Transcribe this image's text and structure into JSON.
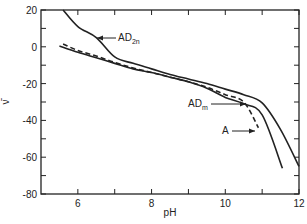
{
  "chart_data": {
    "type": "line",
    "title": "",
    "xlabel": "pH",
    "ylabel": "ν̄",
    "xlim": [
      5,
      12
    ],
    "ylim": [
      -80,
      20
    ],
    "x_ticks": [
      6,
      7,
      8,
      9,
      10,
      11,
      12
    ],
    "x_tick_labels": [
      "6",
      "8",
      "10",
      "12"
    ],
    "y_ticks": [
      20,
      10,
      0,
      -10,
      -20,
      -30,
      -40,
      -50,
      -60,
      -70,
      -80
    ],
    "y_tick_labels": [
      "20",
      "0",
      "-20",
      "-40",
      "-60",
      "-80"
    ],
    "grid": false,
    "legend": "inline annotations",
    "series": [
      {
        "name": "AD2n",
        "style": "solid",
        "x": [
          5.6,
          6.0,
          6.5,
          7.0,
          7.5,
          8.0,
          8.5,
          9.0,
          9.5,
          10.0,
          10.5,
          11.0,
          11.5,
          12.0
        ],
        "y": [
          20,
          11,
          5,
          -5.5,
          -9,
          -12,
          -15,
          -17.5,
          -20,
          -23,
          -26,
          -30.5,
          -45,
          -65
        ]
      },
      {
        "name": "ADm",
        "style": "dashed",
        "x": [
          5.6,
          6.0,
          6.5,
          7.0,
          7.5,
          8.0,
          8.5,
          9.0,
          9.5,
          10.0,
          10.5,
          10.9
        ],
        "y": [
          1.5,
          -2,
          -5,
          -8.5,
          -11.5,
          -14,
          -16.5,
          -19,
          -22,
          -26,
          -30,
          -44
        ]
      },
      {
        "name": "A",
        "style": "solid",
        "x": [
          5.5,
          6.0,
          6.5,
          7.0,
          7.5,
          8.0,
          8.5,
          9.0,
          9.5,
          10.0,
          10.5,
          11.0,
          11.55
        ],
        "y": [
          0.4,
          -3,
          -6,
          -9,
          -12,
          -14,
          -16.5,
          -19,
          -22.5,
          -27.5,
          -31,
          -37,
          -66
        ]
      }
    ],
    "annotations": [
      {
        "text": "AD",
        "subscript": "2n",
        "target": "AD2n"
      },
      {
        "text": "AD",
        "subscript": "m",
        "target": "ADm"
      },
      {
        "text": "A",
        "subscript": "",
        "target": "A"
      }
    ]
  }
}
